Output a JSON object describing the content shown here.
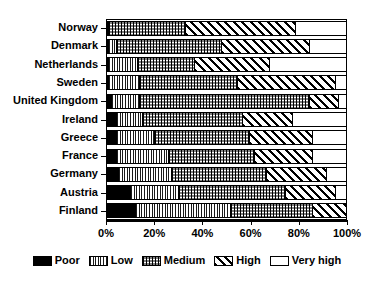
{
  "chart_data": {
    "type": "bar",
    "orientation": "horizontal",
    "stacked": true,
    "stack_normalized": true,
    "title": "",
    "subtitle": "",
    "xlabel": "",
    "ylabel": "",
    "xlim": [
      0,
      100
    ],
    "xticks": [
      0,
      20,
      40,
      60,
      80,
      100
    ],
    "xticklabels": [
      "0%",
      "20%",
      "40%",
      "60%",
      "80%",
      "100%"
    ],
    "grid": false,
    "legend_position": "bottom",
    "categories": [
      "Norway",
      "Denmark",
      "Netherlands",
      "Sweden",
      "United Kingdom",
      "Ireland",
      "Greece",
      "France",
      "Germany",
      "Austria",
      "Finland"
    ],
    "series": [
      {
        "name": "Poor",
        "pattern": "solid-black",
        "color": "#000000",
        "values": [
          1,
          1,
          1,
          1,
          2,
          4,
          4,
          4,
          5,
          10,
          12
        ]
      },
      {
        "name": "Low",
        "pattern": "vertical-lines",
        "color": "#d8d8d8",
        "values": [
          0,
          3,
          12,
          13,
          12,
          11,
          16,
          22,
          22,
          20,
          40
        ]
      },
      {
        "name": "Medium",
        "pattern": "checkerboard",
        "color": "#999999",
        "values": [
          32,
          44,
          24,
          41,
          71,
          42,
          40,
          36,
          40,
          45,
          34
        ]
      },
      {
        "name": "High",
        "pattern": "diagonal-hatch",
        "color": "#ffffff",
        "values": [
          46,
          37,
          31,
          41,
          12,
          21,
          26,
          24,
          25,
          21,
          14
        ]
      },
      {
        "name": "Very high",
        "pattern": "empty-white",
        "color": "#ffffff",
        "values": [
          21,
          15,
          32,
          4,
          3,
          22,
          14,
          14,
          8,
          4,
          0
        ]
      }
    ]
  },
  "legend": {
    "items": [
      {
        "label": "Poor"
      },
      {
        "label": "Low"
      },
      {
        "label": "Medium"
      },
      {
        "label": "High"
      },
      {
        "label": "Very high"
      }
    ]
  }
}
